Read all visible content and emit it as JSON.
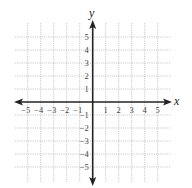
{
  "chart_data": {
    "type": "coordinate-grid",
    "title": "",
    "xlabel": "x",
    "ylabel": "y",
    "xlim": [
      -5,
      5
    ],
    "ylim": [
      -5,
      5
    ],
    "grid": true,
    "grid_style": "dotted",
    "x_tick_labels": [
      "−5",
      "−4",
      "−3",
      "−2",
      "−1",
      "1",
      "2",
      "3",
      "4",
      "5"
    ],
    "y_tick_labels": [
      "5",
      "4",
      "3",
      "2",
      "1",
      "−1",
      "−2",
      "−3",
      "−4",
      "−5"
    ],
    "x_ticks": [
      -5,
      -4,
      -3,
      -2,
      -1,
      1,
      2,
      3,
      4,
      5
    ],
    "y_ticks": [
      5,
      4,
      3,
      2,
      1,
      -1,
      -2,
      -3,
      -4,
      -5
    ],
    "series": []
  },
  "axes": {
    "x_label": "x",
    "y_label": "y"
  },
  "colors": {
    "axis": "#222222",
    "grid": "#bdbdbd",
    "text": "#444444"
  }
}
